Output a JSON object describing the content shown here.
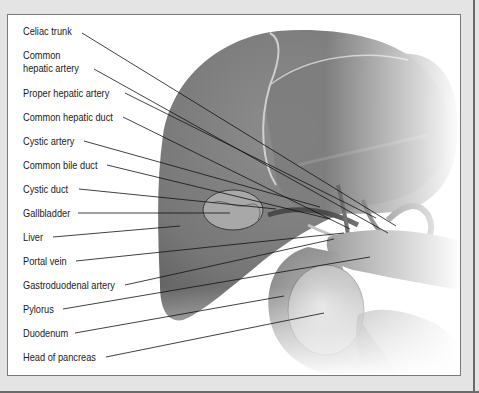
{
  "figure": {
    "labels": [
      {
        "text": "Celiac trunk",
        "y": 11,
        "tx": 74,
        "ty": 18,
        "ex": 388,
        "ey": 211
      },
      {
        "text": "Common\nhepatic artery",
        "y": 35,
        "tx": 86,
        "ty": 54,
        "ex": 380,
        "ey": 218
      },
      {
        "text": "Proper hepatic artery",
        "y": 78,
        "tx": 117,
        "ty": 78,
        "ex": 368,
        "ey": 203
      },
      {
        "text": "Common hepatic duct",
        "y": 102,
        "tx": 115,
        "ty": 102,
        "ex": 342,
        "ey": 214
      },
      {
        "text": "Cystic artery",
        "y": 126,
        "tx": 76,
        "ty": 126,
        "ex": 312,
        "ey": 192
      },
      {
        "text": "Common bile duct",
        "y": 150,
        "tx": 99,
        "ty": 150,
        "ex": 322,
        "ey": 204
      },
      {
        "text": "Cystic duct",
        "y": 174,
        "tx": 71,
        "ty": 174,
        "ex": 268,
        "ey": 194
      },
      {
        "text": "Gallbladder",
        "y": 198,
        "tx": 70,
        "ty": 198,
        "ex": 222,
        "ey": 198
      },
      {
        "text": "Liver",
        "y": 222,
        "tx": 45,
        "ty": 222,
        "ex": 172,
        "ey": 211
      },
      {
        "text": "Portal vein",
        "y": 246,
        "tx": 68,
        "ty": 246,
        "ex": 336,
        "ey": 218
      },
      {
        "text": "Gastroduodenal artery",
        "y": 270,
        "tx": 117,
        "ty": 270,
        "ex": 326,
        "ey": 224
      },
      {
        "text": "Pylorus",
        "y": 294,
        "tx": 55,
        "ty": 294,
        "ex": 362,
        "ey": 242
      },
      {
        "text": "Duodenum",
        "y": 318,
        "tx": 67,
        "ty": 318,
        "ex": 276,
        "ey": 281
      },
      {
        "text": "Head of pancreas",
        "y": 342,
        "tx": 98,
        "ty": 342,
        "ex": 316,
        "ey": 298
      }
    ]
  }
}
